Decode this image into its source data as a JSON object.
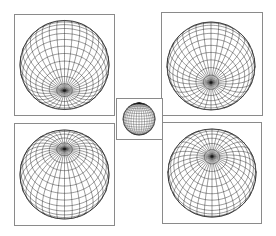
{
  "figure": {
    "line_color": "#1a1a1a",
    "border_color": "#8a8a8a",
    "panels": [
      {
        "id": "top-left",
        "label": "Sphere, pole facing down-front",
        "x": 14,
        "y": 14,
        "w": 101,
        "h": 102,
        "cx": 0.5,
        "cy": 0.5,
        "r": 0.45,
        "tilt": -55,
        "roll": 0
      },
      {
        "id": "top-right",
        "label": "Sphere, pole facing down",
        "x": 161,
        "y": 12,
        "w": 102,
        "h": 104,
        "cx": 0.49,
        "cy": 0.52,
        "r": 0.44,
        "tilt": -68,
        "roll": 0
      },
      {
        "id": "center",
        "label": "Small sphere, equatorial view",
        "x": 116,
        "y": 98,
        "w": 47,
        "h": 42,
        "cx": 0.49,
        "cy": 0.5,
        "r": 0.4,
        "tilt": 10,
        "roll": 0
      },
      {
        "id": "bottom-left",
        "label": "Sphere, pole facing up-front",
        "x": 14,
        "y": 123,
        "w": 101,
        "h": 103,
        "cx": 0.5,
        "cy": 0.5,
        "r": 0.45,
        "tilt": 55,
        "roll": 0
      },
      {
        "id": "bottom-right",
        "label": "Sphere, pole facing up",
        "x": 162,
        "y": 122,
        "w": 100,
        "h": 102,
        "cx": 0.5,
        "cy": 0.5,
        "r": 0.45,
        "tilt": 68,
        "roll": 0
      }
    ],
    "grid": {
      "meridians": 36,
      "parallels": 18
    }
  }
}
